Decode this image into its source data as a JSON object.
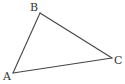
{
  "diagram": {
    "type": "triangle",
    "stroke_color": "#444444",
    "label_color": "#333333",
    "background": "#ffffff",
    "vertices": [
      {
        "name": "A",
        "label": "A",
        "x": 13,
        "y": 73,
        "label_x": 3,
        "label_y": 80
      },
      {
        "name": "B",
        "label": "B",
        "x": 40,
        "y": 13,
        "label_x": 30,
        "label_y": 11
      },
      {
        "name": "C",
        "label": "C",
        "x": 112,
        "y": 58,
        "label_x": 114,
        "label_y": 64
      }
    ],
    "edges": [
      {
        "name": "AB",
        "from": "A",
        "to": "B"
      },
      {
        "name": "BC",
        "from": "B",
        "to": "C"
      },
      {
        "name": "CA",
        "from": "C",
        "to": "A"
      }
    ]
  }
}
